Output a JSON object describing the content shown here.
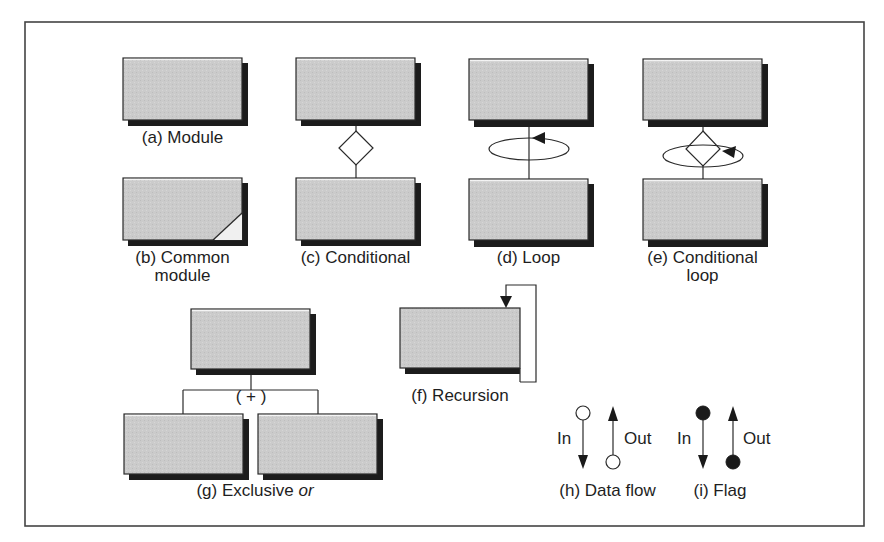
{
  "figure": {
    "frame": {
      "x": 25,
      "y": 22,
      "width": 839,
      "height": 504
    },
    "colors": {
      "box_fill": "#c9c9c9",
      "box_border": "#2a2a2a",
      "shadow": "#1c1c1c",
      "line": "#2a2a2a",
      "frame": "#444444",
      "flag_fill": "#1a1a1a",
      "background": "#ffffff"
    }
  },
  "symbols": {
    "a": {
      "label": "(a) Module"
    },
    "b": {
      "label_line1": "(b) Common",
      "label_line2": "module"
    },
    "c": {
      "label": "(c) Conditional"
    },
    "d": {
      "label": "(d) Loop"
    },
    "e": {
      "label_line1": "(e) Conditional",
      "label_line2": "loop"
    },
    "f": {
      "label": "(f) Recursion"
    },
    "g": {
      "label_prefix": "(g) Exclusive ",
      "label_italic": "or",
      "xor_marker": "( + )"
    },
    "h": {
      "label": "(h) Data flow",
      "in_label": "In",
      "out_label": "Out"
    },
    "i": {
      "label": "(i) Flag",
      "in_label": "In",
      "out_label": "Out"
    }
  }
}
